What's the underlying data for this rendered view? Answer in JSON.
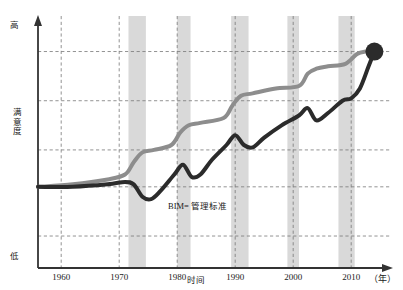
{
  "chart_data": {
    "type": "line",
    "title": "",
    "xlabel": "时间",
    "ylabel": "满意度",
    "x_unit": "（年）",
    "grid": true,
    "legend_position": "none",
    "x_tick_labels": [
      "1960",
      "1970",
      "1980",
      "1990",
      "2000",
      "2010"
    ],
    "x_tick_values": [
      1960,
      1970,
      1980,
      1990,
      2000,
      2010
    ],
    "xlim": [
      1956,
      2016
    ],
    "ylim": [
      0,
      100
    ],
    "y_axis_top_label": "高",
    "y_axis_bottom_label": "低",
    "y_gridline_values": [
      88,
      68,
      48,
      33,
      13
    ],
    "annotations": [
      {
        "text": "BIM= 管理标准",
        "x": 1988,
        "y": 20
      }
    ],
    "shaded_bands": [
      {
        "x0": 1971.6,
        "x1": 1974.6
      },
      {
        "x0": 1980.0,
        "x1": 1982.3
      },
      {
        "x0": 1989.3,
        "x1": 1992.3
      },
      {
        "x0": 1999.0,
        "x1": 2001.0
      },
      {
        "x0": 2007.8,
        "x1": 2010.6
      }
    ],
    "series": [
      {
        "name": "上曲线",
        "color": "#8d8d8d",
        "line_width": 4,
        "x": [
          1956,
          1962,
          1968,
          1971,
          1972.5,
          1974,
          1976,
          1979,
          1980.5,
          1982,
          1984,
          1988,
          1989.5,
          1991,
          1993,
          1997,
          2001,
          2002.5,
          2004,
          2006,
          2009,
          2011,
          2012.5,
          2014
        ],
        "y": [
          33,
          34,
          36,
          38,
          43,
          47,
          48,
          50,
          55,
          58,
          59,
          61,
          66,
          70,
          71,
          73,
          74,
          79,
          81,
          82,
          83,
          87,
          88,
          88
        ]
      },
      {
        "name": "下曲线",
        "color": "#2b2b2b",
        "line_width": 4,
        "marker": {
          "shape": "circle",
          "x": 2014,
          "y": 88,
          "size": 18
        },
        "x": [
          1956,
          1962,
          1968,
          1971,
          1972.5,
          1974,
          1975.5,
          1977,
          1979.5,
          1981,
          1982.5,
          1984,
          1986,
          1988.5,
          1990,
          1991.5,
          1993,
          1995,
          1998,
          2001,
          2002.5,
          2004,
          2006,
          2008.5,
          2010,
          2011.5,
          2013,
          2014
        ],
        "y": [
          33,
          33,
          34,
          35,
          34,
          29,
          28,
          31,
          38,
          42,
          37,
          38,
          44,
          50,
          54,
          50,
          49,
          53,
          58,
          62,
          65,
          60,
          63,
          68,
          69,
          73,
          82,
          88
        ]
      }
    ]
  },
  "axis": {
    "y_high": "高",
    "y_low": "低",
    "y_title": "满意度",
    "x_title": "时间",
    "x_unit": "（年）"
  },
  "colors": {
    "upper_curve": "#8d8d8d",
    "lower_curve": "#2b2b2b",
    "band": "#d9d9d9",
    "grid": "#777777",
    "axis": "#333333",
    "background": "#ffffff"
  }
}
